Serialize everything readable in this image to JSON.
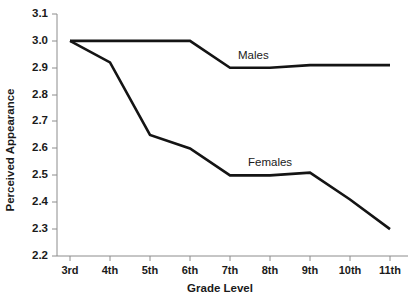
{
  "chart_data": {
    "type": "line",
    "title": "",
    "xlabel": "Grade Level",
    "ylabel": "Perceived Appearance",
    "categories": [
      "3rd",
      "4th",
      "5th",
      "6th",
      "7th",
      "8th",
      "9th",
      "10th",
      "11th"
    ],
    "ylim": [
      2.2,
      3.1
    ],
    "yticks": [
      "2.2",
      "2.3",
      "2.4",
      "2.5",
      "2.6",
      "2.7",
      "2.8",
      "2.9",
      "3.0",
      "3.1"
    ],
    "grid": false,
    "legend_position": "inline-labels",
    "series": [
      {
        "name": "Males",
        "values": [
          3.0,
          3.0,
          3.0,
          3.0,
          2.9,
          2.9,
          2.91,
          2.91,
          2.91
        ],
        "label_text": "Males"
      },
      {
        "name": "Females",
        "values": [
          3.0,
          2.92,
          2.65,
          2.6,
          2.5,
          2.5,
          2.51,
          2.41,
          2.3
        ],
        "label_text": "Females"
      }
    ]
  },
  "axes": {
    "y_title": "Perceived Appearance",
    "x_title": "Grade Level"
  },
  "labels": {
    "males": "Males",
    "females": "Females"
  }
}
